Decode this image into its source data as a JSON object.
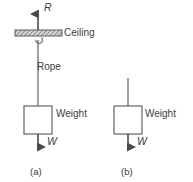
{
  "figure": {
    "background_color": "#ffffff",
    "stroke_color": "#595959",
    "text_color": "#3d3d3d",
    "hatch_color": "#808080"
  },
  "labels": {
    "reaction_force": "R",
    "ceiling": "Ceiling",
    "rope": "Rope",
    "weight_a": "Weight",
    "weight_force_a": "W",
    "weight_b": "Weight",
    "weight_force_b": "W",
    "panel_a": "(a)",
    "panel_b": "(b)"
  },
  "panels": [
    {
      "id": "a",
      "caption": "(a)",
      "elements": [
        "reaction-arrow",
        "ceiling-bar",
        "hook",
        "rope",
        "weight-box",
        "weight-arrow"
      ]
    },
    {
      "id": "b",
      "caption": "(b)",
      "elements": [
        "rope-stub",
        "weight-box",
        "weight-arrow"
      ]
    }
  ],
  "geometry": {
    "ceiling_bar": {
      "x": 15,
      "y": 30,
      "width": 47,
      "height": 6
    },
    "rope_a": {
      "x": 38,
      "y_top": 36,
      "y_bottom": 106
    },
    "weight_box_a": {
      "x": 24,
      "y": 106,
      "width": 28,
      "height": 28
    },
    "weight_arrow_a": {
      "x": 38,
      "y_top": 134,
      "y_bottom": 150
    },
    "reaction_arrow": {
      "x": 38,
      "y_top": 11,
      "y_bottom": 33
    },
    "rope_b": {
      "x": 128,
      "y_top": 78,
      "y_bottom": 106
    },
    "weight_box_b": {
      "x": 114,
      "y": 106,
      "width": 28,
      "height": 28
    },
    "weight_arrow_b": {
      "x": 128,
      "y_top": 134,
      "y_bottom": 150
    }
  }
}
